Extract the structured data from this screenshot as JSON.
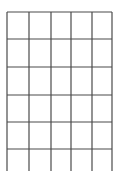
{
  "grid": {
    "line_color": "#4a4a4a",
    "line_width": 1.2,
    "vertical_lines_x": [
      7,
      29,
      51,
      71,
      92,
      112
    ],
    "horizontal_lines_y": [
      12,
      39,
      67,
      95,
      122,
      149
    ],
    "vertical_top": 12,
    "vertical_bottom": 171,
    "horizontal_left": 7,
    "horizontal_right": 112,
    "columns": 5,
    "rows_closed": 5,
    "open_bottom_row": true
  }
}
